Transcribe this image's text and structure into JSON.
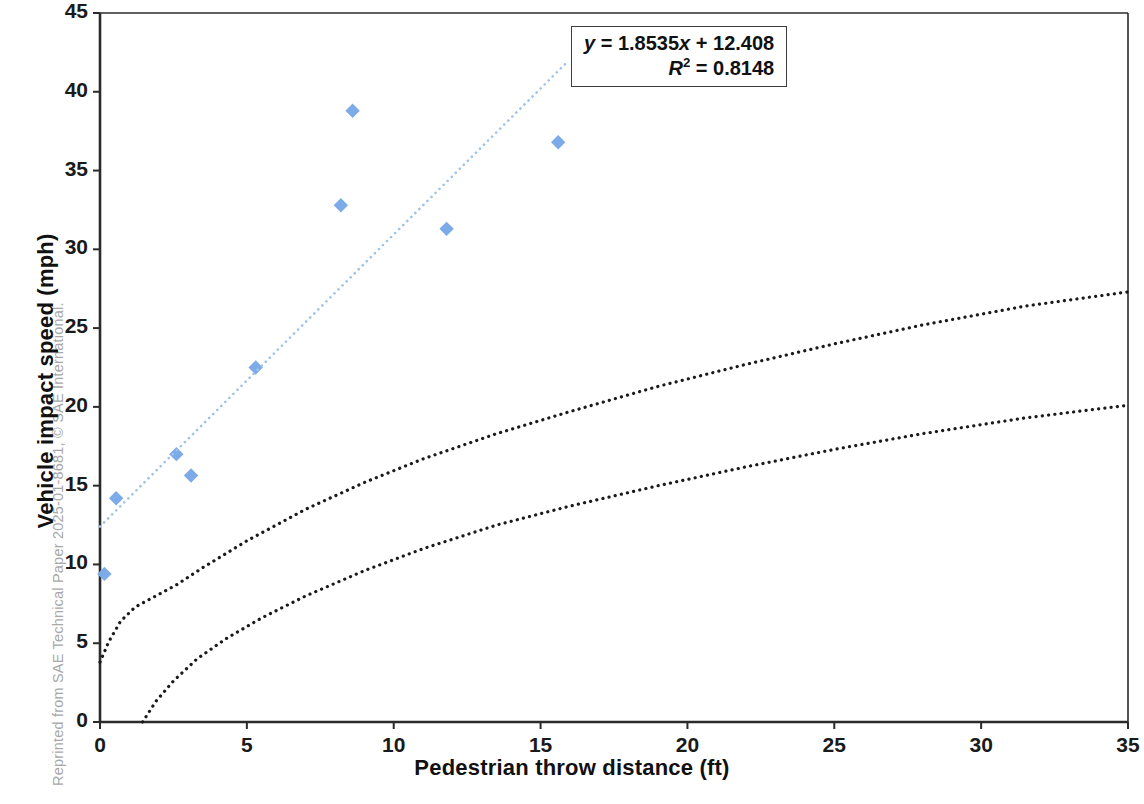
{
  "figure": {
    "reprint_credit": "Reprinted from SAE Technical Paper 2025-01-8681, © SAE International.",
    "equation_line1": "y = 1.8535x + 12.408",
    "equation_line2": "R² = 0.8148",
    "eq_y_symbol": "y",
    "eq_y_rest": " = 1.8535",
    "eq_x_symbol": "x",
    "eq_x_rest": " + 12.408",
    "eq_r_symbol": "R",
    "eq_r_sup": "2",
    "eq_r_rest": " = 0.8148"
  },
  "colors": {
    "marker": "#7cabe8",
    "trendline": "#9dc3e6",
    "reference_curve": "#1a1a1a",
    "axis": "#2b2b2b",
    "text": "#1a1a1a",
    "credit_text": "#a8a8a8"
  },
  "chart_data": {
    "type": "scatter",
    "title": "",
    "xlabel": "Pedestrian throw distance (ft)",
    "ylabel": "Vehicle impact speed (mph)",
    "xlim": [
      0,
      35
    ],
    "ylim": [
      0,
      45
    ],
    "xticks": [
      0,
      5,
      10,
      15,
      20,
      25,
      30,
      35
    ],
    "yticks": [
      0,
      5,
      10,
      15,
      20,
      25,
      30,
      35,
      40,
      45
    ],
    "xtick_labels": [
      "0",
      "5",
      "10",
      "15",
      "20",
      "25",
      "30",
      "35"
    ],
    "ytick_labels": [
      "0",
      "5",
      "10",
      "15",
      "20",
      "25",
      "30",
      "35",
      "40",
      "45"
    ],
    "grid": false,
    "legend": null,
    "series": [
      {
        "name": "Test data",
        "type": "scatter",
        "marker": "diamond",
        "color": "#7cabe8",
        "points": [
          {
            "x": 0.15,
            "y": 9.4
          },
          {
            "x": 0.55,
            "y": 14.2
          },
          {
            "x": 2.6,
            "y": 17.0
          },
          {
            "x": 3.1,
            "y": 15.65
          },
          {
            "x": 5.3,
            "y": 22.5
          },
          {
            "x": 8.2,
            "y": 32.8
          },
          {
            "x": 8.6,
            "y": 38.8
          },
          {
            "x": 11.8,
            "y": 31.3
          },
          {
            "x": 15.6,
            "y": 36.8
          }
        ]
      },
      {
        "name": "Linear trendline",
        "type": "line",
        "style": "dotted",
        "color": "#9dc3e6",
        "slope": 1.8535,
        "intercept": 12.408,
        "x_start": 0,
        "x_end": 15.95,
        "y_start": 12.408,
        "y_end": 41.97
      },
      {
        "name": "Upper reference curve",
        "type": "line",
        "style": "dotted",
        "color": "#1a1a1a",
        "points": [
          {
            "x": 0.0,
            "y": 3.8
          },
          {
            "x": 0.3,
            "y": 5.1
          },
          {
            "x": 0.7,
            "y": 6.4
          },
          {
            "x": 1.2,
            "y": 7.3
          },
          {
            "x": 1.8,
            "y": 7.9
          },
          {
            "x": 2.6,
            "y": 8.7
          },
          {
            "x": 3.5,
            "y": 9.8
          },
          {
            "x": 5.0,
            "y": 11.5
          },
          {
            "x": 7.0,
            "y": 13.5
          },
          {
            "x": 9.0,
            "y": 15.2
          },
          {
            "x": 11.0,
            "y": 16.7
          },
          {
            "x": 13.5,
            "y": 18.3
          },
          {
            "x": 16.0,
            "y": 19.7
          },
          {
            "x": 19.0,
            "y": 21.3
          },
          {
            "x": 22.0,
            "y": 22.7
          },
          {
            "x": 25.0,
            "y": 24.0
          },
          {
            "x": 28.0,
            "y": 25.2
          },
          {
            "x": 31.5,
            "y": 26.4
          },
          {
            "x": 35.0,
            "y": 27.3
          }
        ]
      },
      {
        "name": "Lower reference curve",
        "type": "line",
        "style": "dotted",
        "color": "#1a1a1a",
        "points": [
          {
            "x": 1.45,
            "y": 0.0
          },
          {
            "x": 1.9,
            "y": 1.3
          },
          {
            "x": 2.5,
            "y": 2.6
          },
          {
            "x": 3.3,
            "y": 4.0
          },
          {
            "x": 4.3,
            "y": 5.3
          },
          {
            "x": 5.5,
            "y": 6.6
          },
          {
            "x": 7.0,
            "y": 8.0
          },
          {
            "x": 9.0,
            "y": 9.6
          },
          {
            "x": 11.0,
            "y": 11.0
          },
          {
            "x": 13.5,
            "y": 12.5
          },
          {
            "x": 16.0,
            "y": 13.7
          },
          {
            "x": 19.0,
            "y": 15.0
          },
          {
            "x": 22.0,
            "y": 16.2
          },
          {
            "x": 25.0,
            "y": 17.3
          },
          {
            "x": 28.0,
            "y": 18.3
          },
          {
            "x": 31.5,
            "y": 19.3
          },
          {
            "x": 35.0,
            "y": 20.1
          }
        ]
      }
    ],
    "annotations": [
      {
        "name": "regression-equation",
        "text": "y = 1.8535x + 12.408",
        "x": 19.0,
        "y": 43.0
      },
      {
        "name": "r-squared",
        "text": "R² = 0.8148",
        "x": 19.0,
        "y": 40.6
      }
    ]
  }
}
